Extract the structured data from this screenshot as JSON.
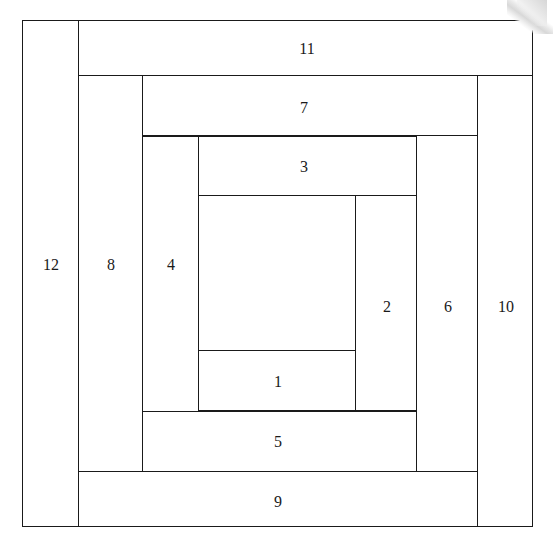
{
  "diagram": {
    "type": "quilt-block-piecing-diagram",
    "background_color": "#ffffff",
    "line_color": "#1a1a1a",
    "label_color": "#1a1a1a",
    "canvas": {
      "width": 553,
      "height": 547
    },
    "pieces": [
      {
        "id": "piece-1",
        "label": "1",
        "x": 198,
        "y": 350,
        "w": 158,
        "h": 61,
        "label_x": 277,
        "label_y": 381
      },
      {
        "id": "piece-2",
        "label": "2",
        "x": 355,
        "y": 195,
        "w": 62,
        "h": 216,
        "label_x": 386,
        "label_y": 306
      },
      {
        "id": "piece-3",
        "label": "3",
        "x": 198,
        "y": 136,
        "w": 219,
        "h": 60,
        "label_x": 303,
        "label_y": 166
      },
      {
        "id": "piece-4",
        "label": "4",
        "x": 142,
        "y": 136,
        "w": 57,
        "h": 276,
        "label_x": 170,
        "label_y": 264
      },
      {
        "id": "piece-5",
        "label": "5",
        "x": 142,
        "y": 411,
        "w": 276,
        "h": 61,
        "label_x": 277,
        "label_y": 441
      },
      {
        "id": "piece-6",
        "label": "6",
        "x": 416,
        "y": 135,
        "w": 62,
        "h": 337,
        "label_x": 447,
        "label_y": 306
      },
      {
        "id": "piece-7",
        "label": "7",
        "x": 142,
        "y": 75,
        "w": 336,
        "h": 61,
        "label_x": 303,
        "label_y": 107
      },
      {
        "id": "piece-8",
        "label": "8",
        "x": 78,
        "y": 75,
        "w": 65,
        "h": 397,
        "label_x": 110,
        "label_y": 264
      },
      {
        "id": "piece-9",
        "label": "9",
        "x": 78,
        "y": 471,
        "w": 400,
        "h": 56,
        "label_x": 277,
        "label_y": 501
      },
      {
        "id": "piece-10",
        "label": "10",
        "x": 477,
        "y": 75,
        "w": 56,
        "h": 452,
        "label_x": 505,
        "label_y": 306
      },
      {
        "id": "piece-11",
        "label": "11",
        "x": 78,
        "y": 20,
        "w": 455,
        "h": 56,
        "label_x": 306,
        "label_y": 48
      },
      {
        "id": "piece-12",
        "label": "12",
        "x": 22,
        "y": 20,
        "w": 57,
        "h": 507,
        "label_x": 50,
        "label_y": 264
      }
    ]
  }
}
